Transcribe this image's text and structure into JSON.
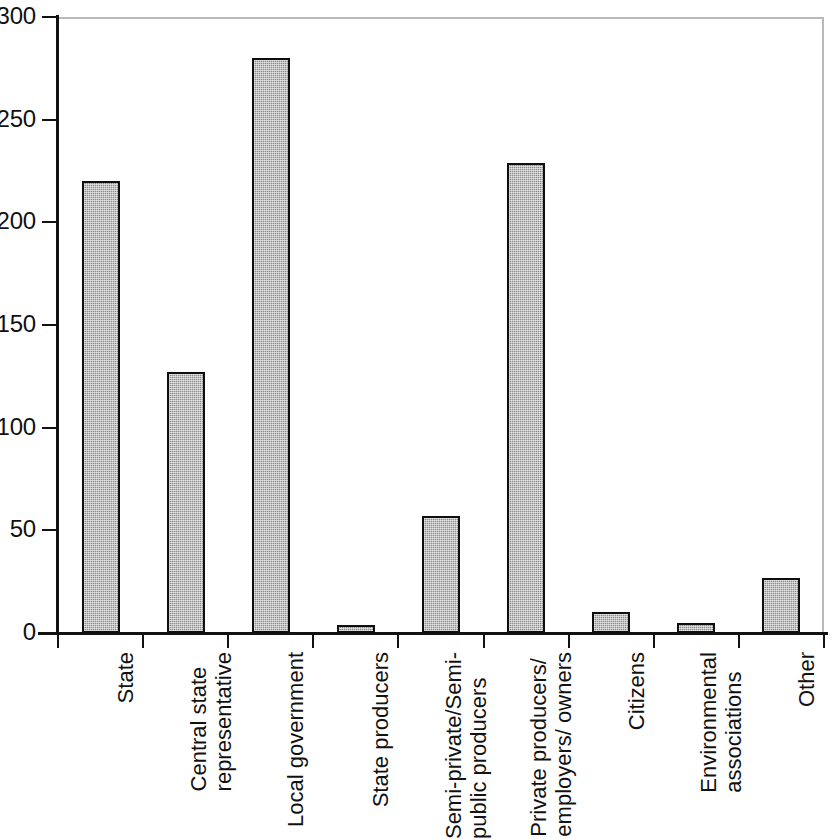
{
  "chart_data": {
    "type": "bar",
    "title": "",
    "subtitle": "",
    "xlabel": "",
    "ylabel": "",
    "ylim": [
      0,
      300
    ],
    "yticks": [
      0,
      50,
      100,
      150,
      200,
      250,
      300
    ],
    "ytick_labels": [
      "0",
      "50",
      "100",
      "150",
      "200",
      "250",
      "300"
    ],
    "grid": false,
    "legend": "none",
    "bar_fill_color": "#8d8d8d",
    "bar_edge_color": "#0e0e0e",
    "axis_color": "#121212",
    "frame_color": "#b9b9b9",
    "background_color": "#ffffff",
    "categories": [
      "State",
      "Central state representative",
      "Local government",
      "State producers",
      "Semi-private/Semi-public producers",
      "Private producers/ employers/ owners",
      "Citizens",
      "Environmental associations",
      "Other"
    ],
    "category_label_lines": [
      [
        "State"
      ],
      [
        "Central state",
        "representative"
      ],
      [
        "Local government"
      ],
      [
        "State producers"
      ],
      [
        "Semi-private/Semi-",
        "public producers"
      ],
      [
        "Private producers/",
        "employers/ owners"
      ],
      [
        "Citizens"
      ],
      [
        "Environmental",
        "associations"
      ],
      [
        "Other"
      ]
    ],
    "values": [
      220,
      127,
      280,
      4,
      57,
      229,
      10,
      5,
      27
    ]
  }
}
